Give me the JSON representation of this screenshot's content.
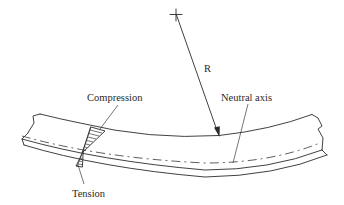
{
  "figure": {
    "type": "beam-bending-diagram",
    "labels": {
      "radius": "R",
      "compression": "Compression",
      "tension": "Tension",
      "neutral_axis": "Neutral axis"
    },
    "colors": {
      "line": "#2b2b2b",
      "text": "#2a2a2a",
      "background": "#ffffff"
    }
  }
}
